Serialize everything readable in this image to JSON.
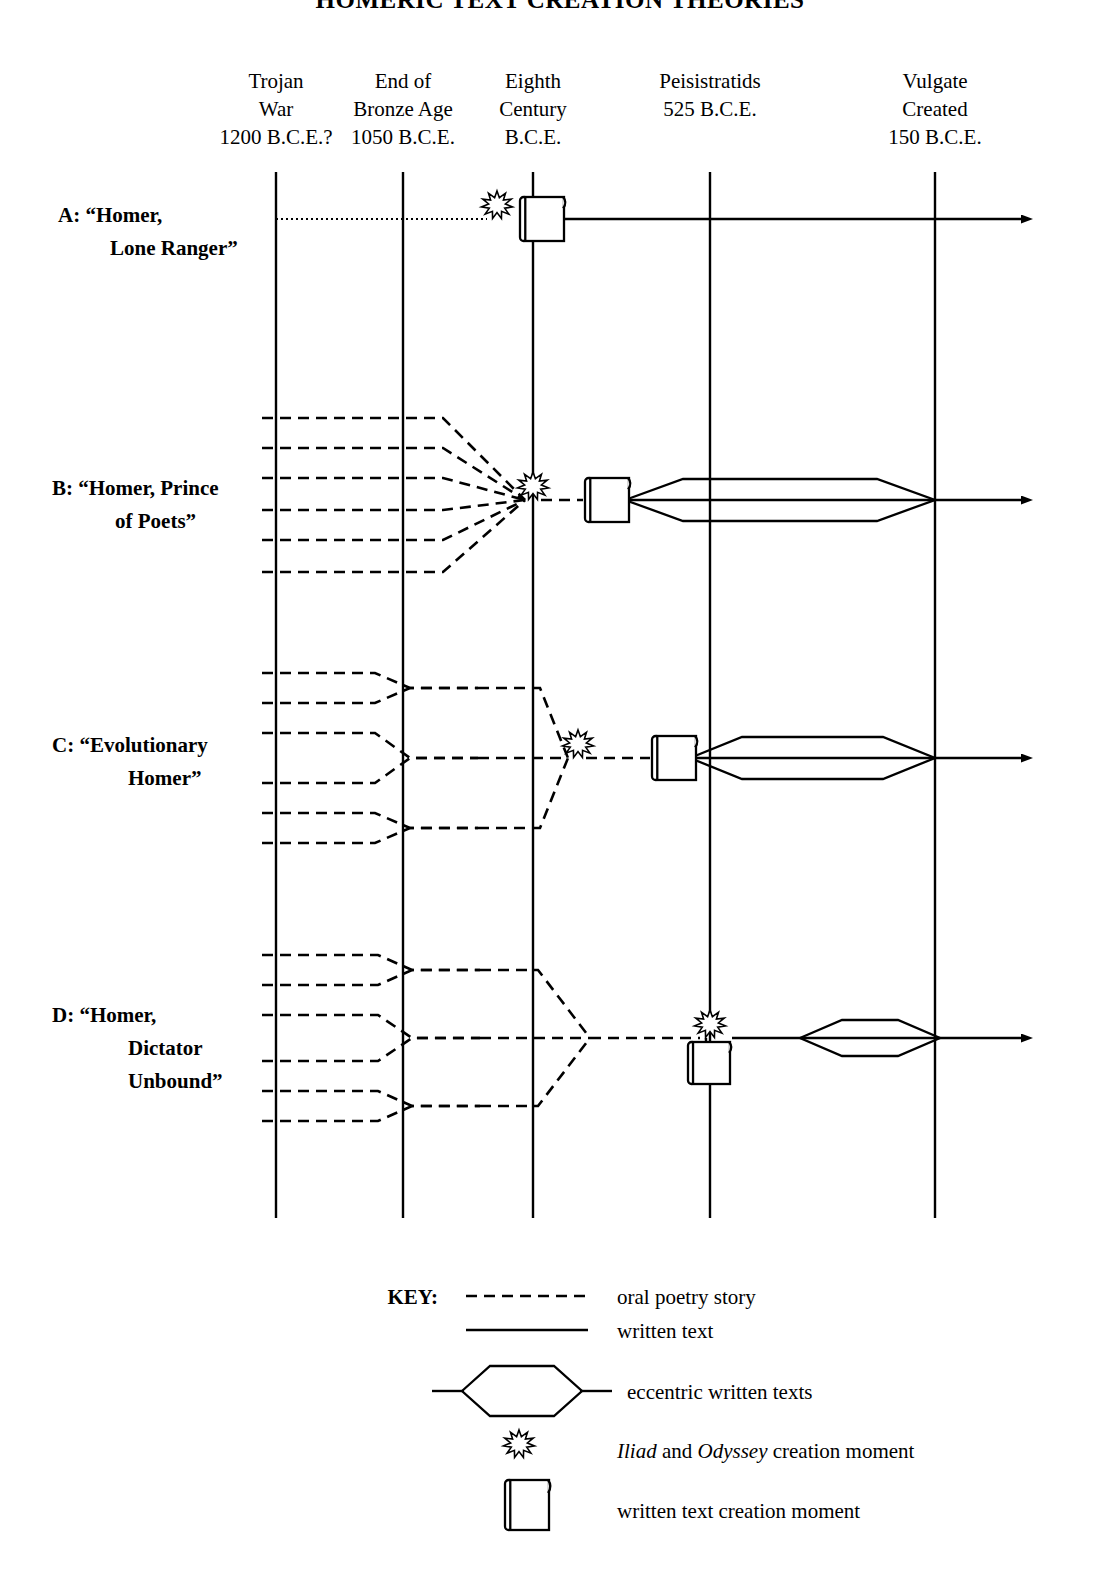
{
  "title": "HOMERIC TEXT CREATION THEORIES",
  "columns": [
    {
      "name": "trojan-war",
      "x": 276,
      "lines": [
        "Trojan",
        "War",
        "1200 B.C.E.?"
      ]
    },
    {
      "name": "end-bronze-age",
      "x": 403,
      "lines": [
        "End of",
        "Bronze Age",
        "1050 B.C.E."
      ]
    },
    {
      "name": "eighth-century",
      "x": 533,
      "lines": [
        "Eighth",
        "Century",
        "B.C.E."
      ]
    },
    {
      "name": "peisistratids",
      "x": 710,
      "lines": [
        "Peisistratids",
        "525 B.C.E.",
        ""
      ]
    },
    {
      "name": "vulgate",
      "x": 935,
      "lines": [
        "Vulgate",
        "Created",
        "150 B.C.E."
      ]
    }
  ],
  "axis": {
    "top": 172,
    "bottom": 1218
  },
  "rows": [
    {
      "name": "row-a",
      "id": "A",
      "label_lines": [
        "A: “Homer,",
        "Lone Ranger”"
      ],
      "label_x": [
        58,
        110
      ],
      "label_y": [
        222,
        255
      ],
      "baseline": 219,
      "burst_x": 497,
      "scroll_x": 520,
      "scroll_below": false,
      "arrow_x": 1022,
      "oral_kind": "dotted-single",
      "oral_start": 276,
      "written_start": 545,
      "hex": null
    },
    {
      "name": "row-b",
      "id": "B",
      "label_lines": [
        "B: “Homer, Prince",
        "of Poets”"
      ],
      "label_x": [
        52,
        115
      ],
      "label_y": [
        495,
        528
      ],
      "baseline": 500,
      "burst_x": 533,
      "scroll_x": 585,
      "scroll_below": false,
      "arrow_x": 1022,
      "oral_kind": "fan",
      "oral_start": 262,
      "fan_break_x": 443,
      "fan_offsets": [
        -82,
        -52,
        -22,
        10,
        40,
        72
      ],
      "written_start": 620,
      "hex": {
        "x1": 625,
        "x2": 935,
        "taper": 58,
        "half": 21
      }
    },
    {
      "name": "row-c",
      "id": "C",
      "label_lines": [
        "C:  “Evolutionary",
        "Homer”"
      ],
      "label_x": [
        52,
        128
      ],
      "label_y": [
        752,
        785
      ],
      "baseline": 758,
      "burst_x": 578,
      "scroll_x": 652,
      "scroll_below": false,
      "arrow_x": 1022,
      "oral_kind": "tree2",
      "oral_start": 262,
      "tree_merge1_x": 375,
      "tree_mid_x": 410,
      "tree_stage2_x": 478,
      "tree_merge2_x": 540,
      "tree_offsets": [
        -85,
        -55,
        -25,
        25,
        55,
        85
      ],
      "written_start": 690,
      "hex": {
        "x1": 690,
        "x2": 935,
        "taper": 52,
        "half": 21
      }
    },
    {
      "name": "row-d",
      "id": "D",
      "label_lines": [
        "D:  “Homer,",
        "Dictator",
        "Unbound”"
      ],
      "label_x": [
        52,
        128,
        128
      ],
      "label_y": [
        1022,
        1055,
        1088
      ],
      "baseline": 1038,
      "burst_x": 710,
      "scroll_x": 700,
      "scroll_below": true,
      "arrow_x": 1022,
      "oral_kind": "tree3",
      "oral_start": 262,
      "tree_merge1_x": 378,
      "tree_mid_x": 412,
      "tree_stage2_x": 480,
      "tree_merge2_x": 538,
      "tree_stage3_x": 590,
      "tree_offsets": [
        -83,
        -53,
        -23,
        23,
        53,
        83
      ],
      "written_start": 732,
      "hex": {
        "x1": 800,
        "x2": 940,
        "taper": 42,
        "half": 18
      }
    }
  ],
  "key": {
    "title": "KEY:",
    "title_x": 438,
    "items": [
      {
        "name": "key-oral",
        "glyph": "dashed-line",
        "label": "oral poetry story",
        "sample_x1": 466,
        "sample_x2": 588,
        "y": 1296,
        "label_x": 617
      },
      {
        "name": "key-written",
        "glyph": "solid-line",
        "label": "written text",
        "sample_x1": 466,
        "sample_x2": 588,
        "y": 1330,
        "label_x": 617
      },
      {
        "name": "key-eccentric",
        "glyph": "hexagon",
        "label": "eccentric written texts",
        "sample_x1": 450,
        "sample_x2": 600,
        "y": 1391,
        "label_x": 627
      },
      {
        "name": "key-creation-moment",
        "glyph": "starburst",
        "label_rich": [
          {
            "t": "Iliad",
            "italic": true
          },
          {
            "t": " and ",
            "italic": false
          },
          {
            "t": "Odyssey",
            "italic": true
          },
          {
            "t": " creation moment",
            "italic": false
          }
        ],
        "label": "Iliad and Odyssey creation moment",
        "sample_x1": 519,
        "y": 1450,
        "label_x": 617
      },
      {
        "name": "key-written-creation",
        "glyph": "scroll",
        "label": "written text creation moment",
        "sample_x1": 519,
        "y": 1510,
        "label_x": 617
      }
    ]
  },
  "colors": {
    "ink": "#000000",
    "paper": "#ffffff"
  }
}
